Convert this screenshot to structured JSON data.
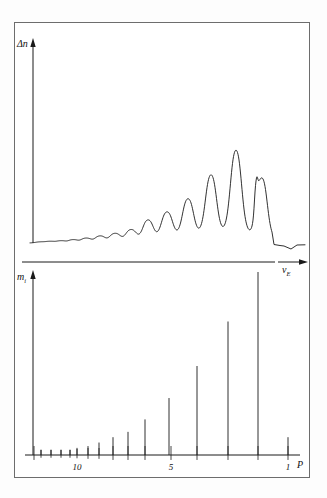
{
  "figure": {
    "kind": "two-panel-spectrum",
    "upper_panel": {
      "y_axis_label": "Δn",
      "x_axis_label": "ν",
      "x_axis_label_sub": "E"
    },
    "lower_panel": {
      "y_axis_label": "m",
      "y_axis_label_sub": "i",
      "x_axis_label": "P",
      "tick_labels": [
        {
          "text": "10",
          "x": 77
        },
        {
          "text": "5",
          "x": 171
        },
        {
          "text": "1",
          "x": 288
        }
      ]
    }
  },
  "chart_data": {
    "type": "line",
    "title": "",
    "panels": [
      {
        "name": "upper",
        "type": "line",
        "ylabel": "Δn",
        "xlabel": "ν_E",
        "grid": false,
        "legend": "none",
        "baseline_y": 243,
        "description": "Continuous spectroscopic trace with a progression of Lorentzian-like peaks growing in amplitude from left to right, followed by a sharp drop and a shallow negative lobe at the far right.",
        "peaks": [
          {
            "x": 40,
            "height": 1.0,
            "width": 6.0,
            "label": "ripple"
          },
          {
            "x": 50,
            "height": 1.5,
            "width": 6.0,
            "label": "ripple"
          },
          {
            "x": 61,
            "height": 2.0,
            "width": 6.0,
            "label": "ripple"
          },
          {
            "x": 73,
            "height": 3.0,
            "width": 6.0,
            "label": "ripple"
          },
          {
            "x": 86,
            "height": 4.5,
            "width": 6.5,
            "label": "ripple"
          },
          {
            "x": 100,
            "height": 6.5,
            "width": 6.5,
            "label": "p12"
          },
          {
            "x": 115,
            "height": 9.0,
            "width": 7.0,
            "label": "p11"
          },
          {
            "x": 131,
            "height": 12.5,
            "width": 7.0,
            "label": "p10"
          },
          {
            "x": 148,
            "height": 22.0,
            "width": 7.0,
            "label": "p9"
          },
          {
            "x": 167,
            "height": 30.0,
            "width": 7.5,
            "label": "p8"
          },
          {
            "x": 188,
            "height": 43.0,
            "width": 7.5,
            "label": "p7"
          },
          {
            "x": 211,
            "height": 67.0,
            "width": 7.5,
            "label": "p6"
          },
          {
            "x": 236,
            "height": 92.0,
            "width": 7.5,
            "label": "p5"
          },
          {
            "x": 256,
            "height": 27.0,
            "width": 2.2,
            "label": "spike"
          },
          {
            "x": 262,
            "height": 64.0,
            "width": 7.0,
            "label": "p4"
          }
        ],
        "tail": {
          "start_x": 272,
          "dip_center_x": 291,
          "dip_depth": -6.0,
          "end_x": 305
        },
        "ylim": [
          0,
          100
        ],
        "xlim": [
          30,
          308
        ]
      },
      {
        "name": "lower",
        "type": "bar",
        "ylabel": "m_i",
        "xlabel": "P",
        "grid": false,
        "legend": "none",
        "baseline_y": 455,
        "description": "Stick (line) spectrum; bar heights grow toward the right, plus one full-height vertical reference line near P=2.",
        "sticks": [
          {
            "x": 41,
            "height": 3
          },
          {
            "x": 51,
            "height": 3
          },
          {
            "x": 61,
            "height": 3
          },
          {
            "x": 70,
            "height": 3
          },
          {
            "x": 77,
            "height": 4
          },
          {
            "x": 88,
            "height": 5
          },
          {
            "x": 99,
            "height": 7
          },
          {
            "x": 113,
            "height": 10
          },
          {
            "x": 128,
            "height": 13
          },
          {
            "x": 145,
            "height": 20
          },
          {
            "x": 169,
            "height": 32
          },
          {
            "x": 197,
            "height": 50
          },
          {
            "x": 228,
            "height": 75
          },
          {
            "x": 258,
            "height": 200,
            "note": "full-height reference line"
          },
          {
            "x": 288,
            "height": 10
          }
        ],
        "x_ticks": [
          {
            "x": 34,
            "len": 9
          },
          {
            "x": 41,
            "len": 5
          },
          {
            "x": 51,
            "len": 5
          },
          {
            "x": 61,
            "len": 5
          },
          {
            "x": 70,
            "len": 5
          },
          {
            "x": 77,
            "len": 6
          },
          {
            "x": 88,
            "len": 7
          },
          {
            "x": 99,
            "len": 7
          },
          {
            "x": 113,
            "len": 9
          },
          {
            "x": 128,
            "len": 9
          },
          {
            "x": 145,
            "len": 9
          },
          {
            "x": 171,
            "len": 9
          },
          {
            "x": 197,
            "len": 9
          },
          {
            "x": 228,
            "len": 9
          },
          {
            "x": 258,
            "len": 9
          },
          {
            "x": 288,
            "len": 9
          }
        ],
        "ylim": [
          0,
          100
        ],
        "xlim": [
          30,
          308
        ]
      }
    ]
  },
  "colors": {
    "ink": "#1a1a1a",
    "frame": "#6d6d6d",
    "background": "#ffffff"
  }
}
